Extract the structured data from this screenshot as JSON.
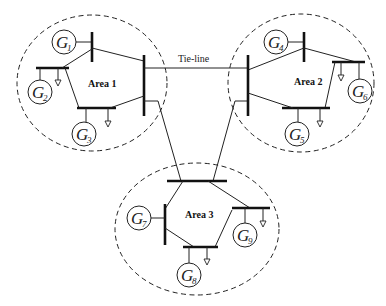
{
  "diagram": {
    "type": "three-area power system single-line diagram",
    "tie_line_label": "Tie-line",
    "areas": [
      {
        "id": "area1",
        "label": "Area 1",
        "cx": 92,
        "cy": 83,
        "rx": 75,
        "ry": 68,
        "lx": 90,
        "ly": 87
      },
      {
        "id": "area2",
        "label": "Area 2",
        "cx": 301,
        "cy": 83,
        "rx": 73,
        "ry": 69,
        "lx": 294,
        "ly": 85
      },
      {
        "id": "area3",
        "label": "Area 3",
        "cx": 197,
        "cy": 229,
        "rx": 82,
        "ry": 66,
        "lx": 185,
        "ly": 218
      }
    ],
    "generators": [
      {
        "id": "G1",
        "letter": "G",
        "sub": "1",
        "cx": 64,
        "cy": 42,
        "r": 12
      },
      {
        "id": "G2",
        "letter": "G",
        "sub": "2",
        "cx": 40,
        "cy": 92,
        "r": 12
      },
      {
        "id": "G3",
        "letter": "G",
        "sub": "3",
        "cx": 84,
        "cy": 134,
        "r": 12
      },
      {
        "id": "G4",
        "letter": "G",
        "sub": "4",
        "cx": 276,
        "cy": 42,
        "r": 12
      },
      {
        "id": "G5",
        "letter": "G",
        "sub": "5",
        "cx": 297,
        "cy": 134,
        "r": 12
      },
      {
        "id": "G6",
        "letter": "G",
        "sub": "6",
        "cx": 360,
        "cy": 91,
        "r": 12
      },
      {
        "id": "G7",
        "letter": "G",
        "sub": "7",
        "cx": 139,
        "cy": 218,
        "r": 12
      },
      {
        "id": "G8",
        "letter": "G",
        "sub": "8",
        "cx": 189,
        "cy": 275,
        "r": 12
      },
      {
        "id": "G9",
        "letter": "G",
        "sub": "9",
        "cx": 245,
        "cy": 235,
        "r": 12
      }
    ],
    "colors": {
      "stroke": "#222222",
      "background": "#ffffff"
    }
  }
}
